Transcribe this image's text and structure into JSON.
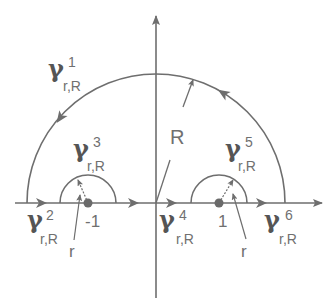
{
  "diagram": {
    "colors": {
      "stroke": "#6e6e6e",
      "text": "#707070",
      "point": "#6a6a6a"
    },
    "axes": {
      "origin_px": [
        156,
        203
      ],
      "x_axis": {
        "from_px": 15,
        "to_px": 322
      },
      "y_axis": {
        "from_px": 298,
        "to_px": 14
      }
    },
    "big_arc": {
      "center_px": [
        156,
        203
      ],
      "radius_px": 129,
      "radius_label": "R"
    },
    "small_arcs": [
      {
        "center_label": "-1",
        "center_px": [
          88,
          203
        ],
        "radius_px": 28,
        "radius_label": "r"
      },
      {
        "center_label": "1",
        "center_px": [
          219,
          203
        ],
        "radius_px": 28,
        "radius_label": "r"
      }
    ],
    "curves": [
      {
        "symbol": "γ",
        "sup": "1",
        "sub": "r,R"
      },
      {
        "symbol": "γ",
        "sup": "2",
        "sub": "r,R"
      },
      {
        "symbol": "γ",
        "sup": "3",
        "sub": "r,R"
      },
      {
        "symbol": "γ",
        "sup": "4",
        "sub": "r,R"
      },
      {
        "symbol": "γ",
        "sup": "5",
        "sub": "r,R"
      },
      {
        "symbol": "γ",
        "sup": "6",
        "sub": "r,R"
      }
    ],
    "labels": {
      "R": "R",
      "r_left": "r",
      "r_right": "r",
      "point_left": "-1",
      "point_right": "1"
    }
  }
}
